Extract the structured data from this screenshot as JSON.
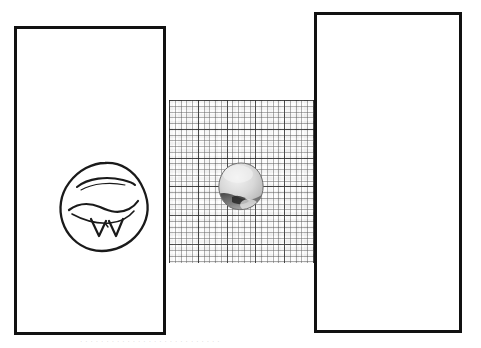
{
  "figure": {
    "background_color": "#ffffff",
    "width": 481,
    "height": 348,
    "frame_color": "#111111",
    "caption_faint": "· · · · · · · · · · · · · · · · · · · · · · · · · · ·"
  },
  "panels": [
    {
      "id": "left",
      "name": "sketch-panel",
      "content_kind": "line-drawing",
      "bordered": true,
      "x": 14,
      "y": 26,
      "width": 152,
      "height": 309
    },
    {
      "id": "center",
      "name": "grid-panel",
      "content_kind": "grid-overlay-photo",
      "bordered": false,
      "x": 169,
      "y": 100,
      "width": 145,
      "height": 163
    },
    {
      "id": "right",
      "name": "photo-panel",
      "content_kind": "grayscale-photo",
      "bordered": true,
      "x": 314,
      "y": 12,
      "width": 148,
      "height": 321
    }
  ],
  "grid": {
    "minor_spacing_px": 5.76,
    "major_spacing_px": 28.8,
    "minor_per_major": 5,
    "minor_color": "#5a5a5a",
    "major_color": "#282828",
    "paper_color": "#fdfdfd"
  },
  "objects": [
    {
      "name": "object-sketch",
      "style": "outline drawing",
      "description": "irregular rounded blob outline with interior contour arcs and two V-shaped marks",
      "center_x": 88,
      "center_y": 178,
      "width": 100,
      "height": 100,
      "stroke_color": "#1a1a1a"
    },
    {
      "name": "object-small",
      "style": "grayscale image on grid",
      "description": "small rounded blob, bright upper surface with dark lower-left shadow band",
      "center_x": 241,
      "center_y": 187,
      "width": 50,
      "height": 52
    },
    {
      "name": "object-large",
      "style": "grayscale image",
      "description": "rounded blob, bright upper lobe, dark horizontal shadow band across middle, bright lower lobe",
      "center_x": 390,
      "center_y": 187,
      "width": 90,
      "height": 96
    }
  ]
}
